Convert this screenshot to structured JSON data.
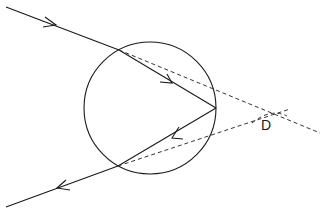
{
  "diagram": {
    "angle_label": "D",
    "colors": {
      "line": "#1a1a1a",
      "background": "#ffffff"
    },
    "circle": {
      "cx": 150,
      "cy": 108,
      "r": 66
    },
    "points": {
      "incoming_start": [
        6,
        7
      ],
      "entry": [
        119,
        50
      ],
      "reflection": [
        216,
        108
      ],
      "exit": [
        118,
        166
      ],
      "outgoing_end": [
        6,
        207
      ]
    },
    "dashed_lines": [
      {
        "from": [
          119,
          50
        ],
        "to": [
          320,
          133
        ]
      },
      {
        "from": [
          118,
          166
        ],
        "to": [
          290,
          109
        ]
      }
    ]
  }
}
